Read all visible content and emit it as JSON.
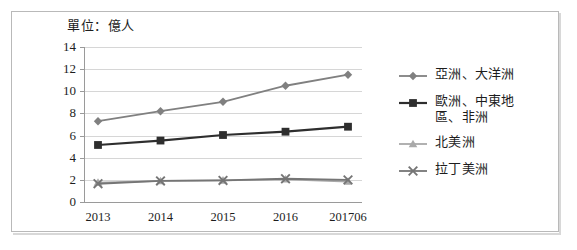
{
  "figure": {
    "unit_label": "單位：億人",
    "frame_color": "#b9b9b9",
    "background": "#ffffff"
  },
  "chart_data": {
    "type": "line",
    "title": "單位：億人",
    "xlabel": "",
    "ylabel": "",
    "ylim": [
      0,
      14
    ],
    "ytick_step": 2,
    "grid": true,
    "legend_position": "right",
    "categories": [
      "2013",
      "2014",
      "2015",
      "2016",
      "201706"
    ],
    "ytick_labels": [
      "14",
      "12",
      "10",
      "8",
      "6",
      "4",
      "2",
      "0"
    ],
    "series": [
      {
        "name": "亞洲、大洋洲",
        "marker": "diamond",
        "color": "#808080",
        "values": [
          7.3,
          8.2,
          9.05,
          10.5,
          11.5
        ]
      },
      {
        "name": "歐洲、中東地\n區、非洲",
        "legend_label_line1": "歐洲、中東地",
        "legend_label_line2": "區、非洲",
        "marker": "square",
        "color": "#2e2e2e",
        "values": [
          5.15,
          5.55,
          6.05,
          6.35,
          6.8
        ]
      },
      {
        "name": "北美洲",
        "marker": "triangle",
        "color": "#a9a9a9",
        "values": [
          1.75,
          1.9,
          1.95,
          2.05,
          1.85
        ]
      },
      {
        "name": "拉丁美洲",
        "marker": "x",
        "color": "#757575",
        "values": [
          1.65,
          1.9,
          1.95,
          2.1,
          2.0
        ]
      }
    ]
  }
}
